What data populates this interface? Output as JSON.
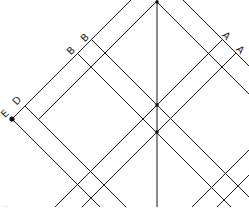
{
  "diagram": {
    "stroke_color": "#1a1a1a",
    "background": "#ffffff",
    "vertical_axis_x": 157,
    "down_right_lines": [
      {
        "id": "outer-right-top",
        "c": -183,
        "from": [
          183,
          0
        ],
        "to": [
          249,
          66
        ]
      },
      {
        "id": "apex-right",
        "c": -155,
        "from": [
          157,
          2
        ],
        "to": [
          249,
          94
        ]
      },
      {
        "id": "B1",
        "c": -52,
        "from": [
          91.5,
          39.5
        ],
        "to": [
          249,
          197
        ]
      },
      {
        "id": "B2",
        "c": -24,
        "from": [
          77.5,
          53.5
        ],
        "to": [
          231,
          207
        ]
      },
      {
        "id": "D",
        "c": 81,
        "from": [
          25,
          106
        ],
        "to": [
          126,
          207
        ]
      },
      {
        "id": "E",
        "c": 107,
        "from": [
          12,
          119
        ],
        "to": [
          100,
          207
        ]
      }
    ],
    "up_right_lines": [
      {
        "id": "outer-left",
        "k": 131,
        "from": [
          12,
          119
        ],
        "to": [
          131,
          0
        ]
      },
      {
        "id": "apex-left",
        "k": 158,
        "from": [
          38,
          120
        ],
        "to": [
          157,
          1
        ]
      },
      {
        "id": "A1",
        "k": 262,
        "from": [
          55,
          207
        ],
        "to": [
          222.5,
          39.5
        ]
      },
      {
        "id": "A2",
        "k": 289,
        "from": [
          82,
          207
        ],
        "to": [
          236,
          53
        ]
      },
      {
        "id": "lower-1",
        "k": 399,
        "from": [
          192,
          207
        ],
        "to": [
          249,
          150
        ]
      },
      {
        "id": "lower-2",
        "k": 424,
        "from": [
          217,
          207
        ],
        "to": [
          249,
          175
        ]
      }
    ],
    "points": [
      {
        "id": "apex",
        "x": 157,
        "y": 2
      },
      {
        "id": "E-point",
        "x": 12,
        "y": 119
      },
      {
        "id": "center-upper",
        "x": 157,
        "y": 105
      },
      {
        "id": "center-lower",
        "x": 157,
        "y": 132
      }
    ],
    "labels": [
      {
        "id": "label-E",
        "text": "E",
        "x": 5,
        "y": 114,
        "rotate": -45
      },
      {
        "id": "label-D",
        "text": "D",
        "x": 17,
        "y": 101,
        "rotate": -45
      },
      {
        "id": "label-B1",
        "text": "B",
        "x": 71,
        "y": 51,
        "rotate": -45
      },
      {
        "id": "label-B2",
        "text": "B",
        "x": 85,
        "y": 38,
        "rotate": -45
      },
      {
        "id": "label-A1",
        "text": "A",
        "x": 226,
        "y": 36,
        "rotate": 45
      },
      {
        "id": "label-A2",
        "text": "A",
        "x": 240,
        "y": 50,
        "rotate": 45
      }
    ]
  },
  "caption": {
    "text": "…",
    "note": "clipped text at bottom-left, illegible"
  }
}
